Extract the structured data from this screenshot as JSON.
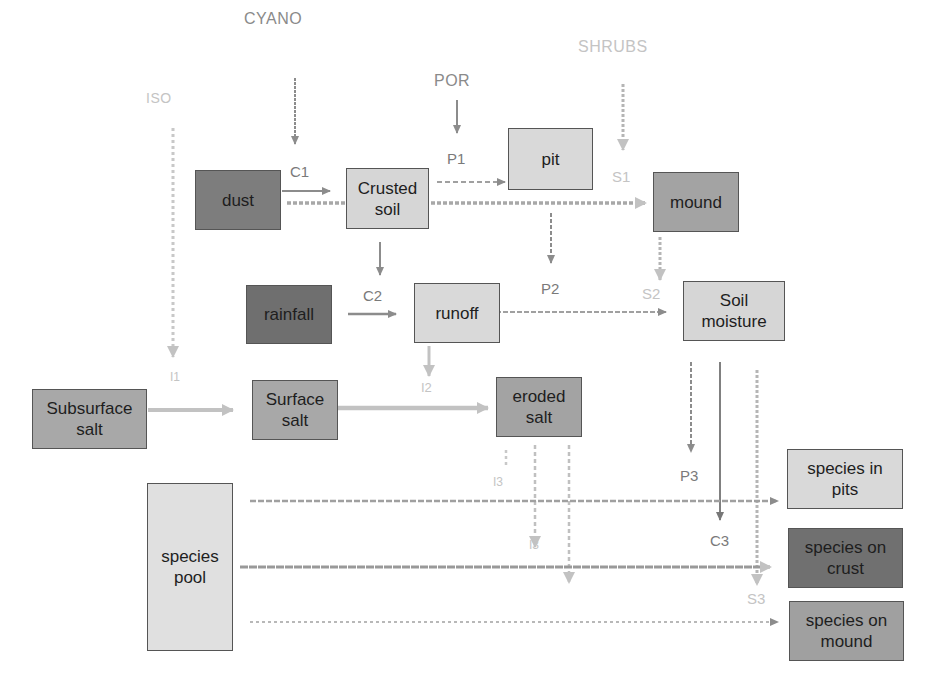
{
  "diagram": {
    "type": "flow-diagram",
    "external_drivers": [
      {
        "id": "cyano",
        "label": "CYANO"
      },
      {
        "id": "por",
        "label": "POR"
      },
      {
        "id": "shrubs",
        "label": "SHRUBS"
      },
      {
        "id": "iso",
        "label": "ISO"
      }
    ],
    "boxes": [
      {
        "id": "dust",
        "label": "dust",
        "fill": "#7d7d7d"
      },
      {
        "id": "crusted_soil",
        "label": "Crusted\nsoil",
        "fill": "#d6d6d6"
      },
      {
        "id": "pit",
        "label": "pit",
        "fill": "#d9d9d9"
      },
      {
        "id": "mound",
        "label": "mound",
        "fill": "#a3a3a3"
      },
      {
        "id": "rainfall",
        "label": "rainfall",
        "fill": "#6f6f6f"
      },
      {
        "id": "runoff",
        "label": "runoff",
        "fill": "#d9d9d9"
      },
      {
        "id": "soil_moisture",
        "label": "Soil\nmoisture",
        "fill": "#d6d6d6"
      },
      {
        "id": "subsurface_salt",
        "label": "Subsurface\nsalt",
        "fill": "#a8a8a8"
      },
      {
        "id": "surface_salt",
        "label": "Surface\nsalt",
        "fill": "#a8a8a8"
      },
      {
        "id": "eroded_salt",
        "label": "eroded\nsalt",
        "fill": "#a3a3a3"
      },
      {
        "id": "species_pool",
        "label": "species\npool",
        "fill": "#e0e0e0"
      },
      {
        "id": "species_in_pits",
        "label": "species in\npits",
        "fill": "#d9d9d9"
      },
      {
        "id": "species_on_crust",
        "label": "species on\ncrust",
        "fill": "#707070"
      },
      {
        "id": "species_on_mound",
        "label": "species on\nmound",
        "fill": "#a0a0a0"
      }
    ],
    "edge_labels": {
      "c1": "C1",
      "c2": "C2",
      "c3": "C3",
      "p1": "P1",
      "p2": "P2",
      "p3": "P3",
      "s1": "S1",
      "s2": "S2",
      "s3": "S3",
      "i1": "I1",
      "i2": "I2",
      "i3": "I3",
      "i3b": "I3"
    },
    "edges": [
      {
        "from": "CYANO",
        "to": "crusted_soil"
      },
      {
        "from": "POR",
        "to": "pit"
      },
      {
        "from": "SHRUBS",
        "to": "mound"
      },
      {
        "from": "ISO",
        "to": "surface_salt"
      },
      {
        "from": "dust",
        "to": "crusted_soil",
        "label": "C1"
      },
      {
        "from": "dust",
        "to": "mound"
      },
      {
        "from": "crusted_soil",
        "to": "pit",
        "label": "P1"
      },
      {
        "from": "crusted_soil",
        "to": "runoff"
      },
      {
        "from": "rainfall",
        "to": "runoff",
        "label": "C2"
      },
      {
        "from": "runoff",
        "to": "soil_moisture",
        "label": "P2"
      },
      {
        "from": "mound",
        "to": "soil_moisture",
        "label": "S2"
      },
      {
        "from": "runoff",
        "to": "eroded_salt",
        "label": "I2"
      },
      {
        "from": "subsurface_salt",
        "to": "surface_salt",
        "label": "I1"
      },
      {
        "from": "surface_salt",
        "to": "eroded_salt"
      },
      {
        "from": "soil_moisture",
        "to": "species_in_pits",
        "label": "P3"
      },
      {
        "from": "soil_moisture",
        "to": "species_on_crust",
        "label": "C3"
      },
      {
        "from": "soil_moisture",
        "to": "species_on_mound",
        "label": "S3"
      },
      {
        "from": "species_pool",
        "to": "species_in_pits"
      },
      {
        "from": "species_pool",
        "to": "species_on_crust"
      },
      {
        "from": "species_pool",
        "to": "species_on_mound"
      },
      {
        "from": "eroded_salt",
        "to": "species_in_pits",
        "label": "I3"
      },
      {
        "from": "eroded_salt",
        "to": "species_on_crust",
        "label": "I3"
      }
    ]
  }
}
